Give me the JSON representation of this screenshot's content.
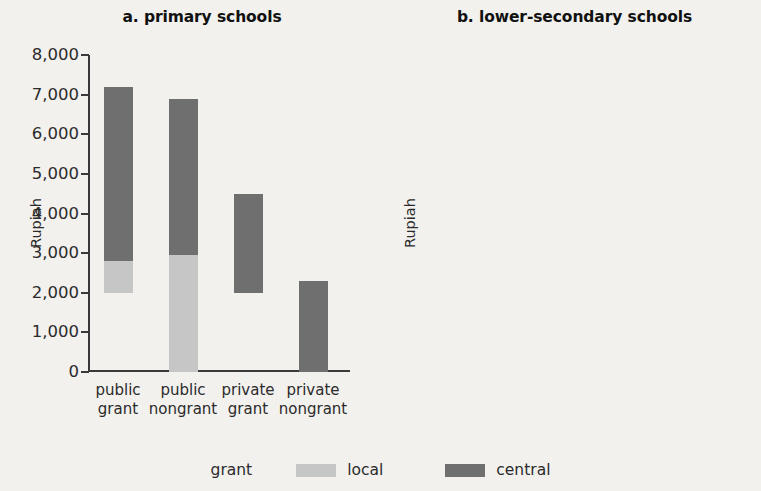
{
  "figure": {
    "background": "#f2f1ee",
    "legend": {
      "title": "grant",
      "items": [
        {
          "label": "local",
          "color": "#c6c6c6",
          "name": "legend-swatch-local"
        },
        {
          "label": "central",
          "color": "#6f6f6f",
          "name": "legend-swatch-central"
        }
      ]
    }
  },
  "chart_data": [
    {
      "type": "bar",
      "panel": "a",
      "title": "a. primary schools",
      "xlabel": "",
      "ylabel": "Rupiah",
      "ylim": [
        0,
        8000
      ],
      "yticks": [
        0,
        1000,
        2000,
        3000,
        4000,
        5000,
        6000,
        7000,
        8000
      ],
      "ytick_labels": [
        "0",
        "1,000",
        "2,000",
        "3,000",
        "4,000",
        "5,000",
        "6,000",
        "7,000",
        "8,000"
      ],
      "grid": false,
      "stacked": true,
      "legend_position": "bottom",
      "categories": [
        "public grant",
        "public nongrant",
        "private grant",
        "private nongrant"
      ],
      "category_lines": [
        [
          "public",
          "grant"
        ],
        [
          "public",
          "nongrant"
        ],
        [
          "private",
          "grant"
        ],
        [
          "private",
          "nongrant"
        ]
      ],
      "bars": [
        {
          "category": "public grant",
          "base": 2000,
          "local_top": 2800,
          "central_top": 7200,
          "total": 7200
        },
        {
          "category": "public nongrant",
          "base": 0,
          "local_top": 2950,
          "central_top": 6900,
          "total": 6900
        },
        {
          "category": "private grant",
          "base": 2000,
          "local_top": 2000,
          "central_top": 4500,
          "total": 4500
        },
        {
          "category": "private nongrant",
          "base": 0,
          "local_top": 0,
          "central_top": 2300,
          "total": 2300
        }
      ],
      "series": [
        {
          "name": "local",
          "values": [
            800,
            2950,
            0,
            0
          ]
        },
        {
          "name": "central",
          "values": [
            4400,
            3950,
            2500,
            2300
          ]
        }
      ]
    },
    {
      "type": "bar",
      "panel": "b",
      "title": "b. lower-secondary schools",
      "xlabel": "",
      "ylabel": "Rupiah",
      "ylim": [
        0,
        140000
      ],
      "yticks": [
        0,
        20000,
        40000,
        60000,
        80000,
        100000,
        120000,
        140000
      ],
      "ytick_labels": [
        "0",
        "20,000",
        "40,000",
        "60,000",
        "80,000",
        "100,000",
        "120,000",
        "140,000"
      ],
      "grid": false,
      "stacked": true,
      "legend_position": "bottom",
      "categories": [
        "public grant",
        "public nongrant",
        "private grant",
        "private nongrant"
      ],
      "category_lines": [
        [
          "public",
          "grant"
        ],
        [
          "public",
          "nongrant"
        ],
        [
          "private",
          "grant"
        ],
        [
          "private",
          "nongrant"
        ]
      ],
      "bars": [
        {
          "category": "public grant",
          "base": 5000,
          "local_top": 5000,
          "central_top": 71500,
          "total": 71500
        },
        {
          "category": "public nongrant",
          "base": 0,
          "local_top": 1500,
          "central_top": 118000,
          "total": 118000
        },
        {
          "category": "private grant",
          "base": 4000,
          "local_top": 4000,
          "central_top": 5500,
          "total": 5500
        },
        {
          "category": "private nongrant",
          "base": 0,
          "local_top": 0,
          "central_top": 2500,
          "total": 2500
        }
      ],
      "series": [
        {
          "name": "local",
          "values": [
            0,
            1500,
            0,
            0
          ]
        },
        {
          "name": "central",
          "values": [
            66500,
            116500,
            1500,
            2500
          ]
        }
      ]
    }
  ]
}
